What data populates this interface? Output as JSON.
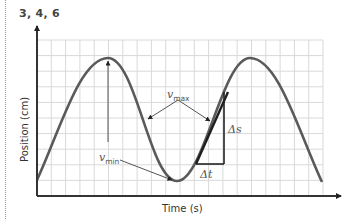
{
  "figure": {
    "label": "3, 4, 6"
  },
  "chart_data": {
    "type": "line",
    "title": "",
    "xlabel": "Time (s)",
    "ylabel": "Position (cm)",
    "grid": true,
    "grid_columns": 20,
    "grid_rows": 10,
    "curve": "sinusoid: starts low, peak, trough, peak, descends",
    "points_px": [
      [
        37,
        180
      ],
      [
        108,
        58
      ],
      [
        177,
        181
      ],
      [
        250,
        58
      ],
      [
        322,
        182
      ]
    ],
    "annotations": [
      {
        "text": "v",
        "sub": "max",
        "meaning": "maximum speed at steepest slopes (two arrows)"
      },
      {
        "text": "v",
        "sub": "min",
        "meaning": "minimum speed at peak/trough (two arrows)"
      },
      {
        "text": "Δs",
        "meaning": "change in position (vertical leg)"
      },
      {
        "text": "Δt",
        "meaning": "change in time (horizontal leg)"
      }
    ]
  },
  "labels": {
    "xlabel": "Time (s)",
    "ylabel": "Position (cm)",
    "vmax_main": "v",
    "vmax_sub": "max",
    "vmin_main": "v",
    "vmin_sub": "min",
    "delta_s": "Δs",
    "delta_t": "Δt"
  },
  "colors": {
    "curve": "#555555",
    "tangent": "#222222",
    "grid": "#d9d9d9",
    "axis": "#333333"
  }
}
